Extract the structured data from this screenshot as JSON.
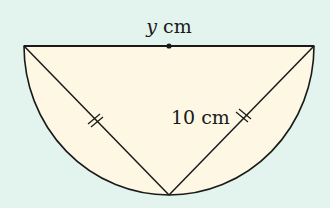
{
  "figure": {
    "type": "semicircle-with-inscribed-triangle",
    "colors": {
      "background": "#e3f3ee",
      "fill": "#fdf7e4",
      "stroke": "#1a1a1a"
    },
    "diameter_label": {
      "variable": "y",
      "unit": " cm"
    },
    "side_label": "10 cm",
    "equal_side_ticks": 2
  }
}
